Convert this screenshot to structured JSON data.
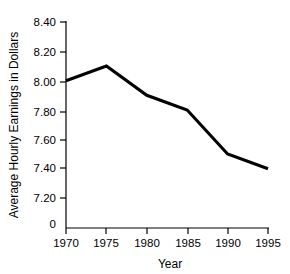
{
  "chart_data": {
    "type": "line",
    "title": "",
    "xlabel": "Year",
    "ylabel": "Average Hourly Earnings in Dollars",
    "categories": [
      "1970",
      "1975",
      "1980",
      "1985",
      "1990",
      "1995"
    ],
    "x": [
      1970,
      1975,
      1980,
      1985,
      1990,
      1995
    ],
    "values": [
      8.0,
      8.1,
      7.9,
      7.8,
      7.5,
      7.4
    ],
    "series": [
      {
        "name": "Average Hourly Earnings",
        "values": [
          8.0,
          8.1,
          7.9,
          7.8,
          7.5,
          7.4
        ]
      }
    ],
    "xlim": [
      1970,
      1995
    ],
    "ylim": [
      7.2,
      8.4
    ],
    "ytick_labels": [
      "8.40",
      "8.20",
      "8.00",
      "7.80",
      "7.60",
      "7.40",
      "7.20",
      "0"
    ],
    "ytick_values": [
      8.4,
      8.2,
      8.0,
      7.8,
      7.6,
      7.4,
      7.2,
      0
    ],
    "xtick_labels": [
      "1970",
      "1975",
      "1980",
      "1985",
      "1990",
      "1995"
    ],
    "grid": false,
    "legend": "none",
    "axis_break": true,
    "line_color": "#000000",
    "background_color": "#ffffff"
  },
  "labels": {
    "y_8_40": "8.40",
    "y_8_20": "8.20",
    "y_8_00": "8.00",
    "y_7_80": "7.80",
    "y_7_60": "7.60",
    "y_7_40": "7.40",
    "y_7_20": "7.20",
    "y_zero": "0",
    "x_1970": "1970",
    "x_1975": "1975",
    "x_1980": "1980",
    "x_1985": "1985",
    "x_1990": "1990",
    "x_1995": "1995",
    "x_axis_title": "Year",
    "y_axis_title": "Average Hourly Earnings in Dollars"
  }
}
